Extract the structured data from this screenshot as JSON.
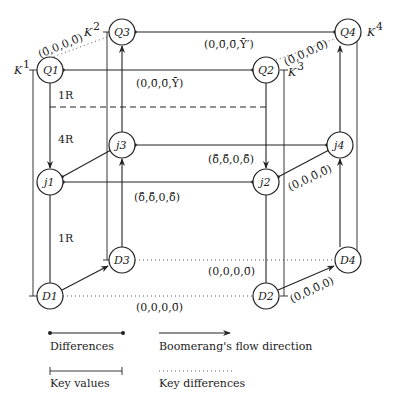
{
  "nodes": {
    "Q1": "Q1",
    "Q2": "Q2",
    "Q3": "Q3",
    "Q4": "Q4",
    "j1": "j1",
    "j2": "j2",
    "j3": "j3",
    "j4": "j4",
    "D1": "D1",
    "D2": "D2",
    "D3": "D3",
    "D4": "D4"
  },
  "keys": {
    "K1": "K",
    "K1sup": "1",
    "K2": "K",
    "K2sup": "2",
    "K3": "K",
    "K3sup": "3",
    "K4": "K",
    "K4sup": "4"
  },
  "labels": {
    "q1_q3_key_diff": "(0̄,0,0,0̄)",
    "q2_q4_key_diff": "(0̄,0,0,0̄)",
    "q1_q2_diff": "(0,0̄,0̄,Ȳ)",
    "q3_q4_diff": "(0,0̄,0̄,Ȳ′)",
    "j1_j2_diff": "(δ̄,δ̄,0,δ̄)",
    "j3_j4_diff": "(δ̄,δ̄,0,δ̄)",
    "j2_j4_diff": "(0,0,0̄,0̄)",
    "d3_d4_diff": "(0,0,0,0̄)",
    "d1_d2_diff": "(0,0,0,0̄)",
    "d2_d4_diff": "(0,0̄,0̄,0)",
    "round_1R_top": "1R",
    "round_4R": "4R",
    "round_1R_bottom": "1R"
  },
  "legend": {
    "differences": "Differences",
    "flow": "Boomerang's flow direction",
    "key_values": "Key values",
    "key_differences": "Key differences"
  }
}
